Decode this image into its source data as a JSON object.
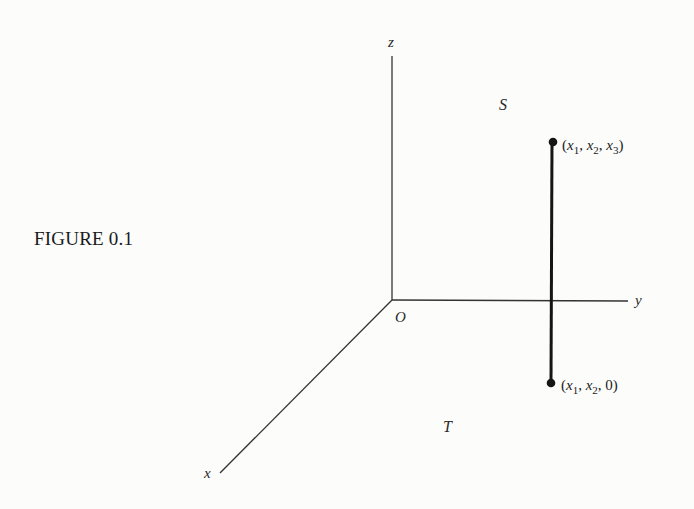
{
  "figure": {
    "caption": "FIGURE 0.1",
    "axes": {
      "origin_label": "O",
      "x_label": "x",
      "y_label": "y",
      "z_label": "z"
    },
    "region_labels": {
      "upper": "S",
      "lower": "T"
    },
    "points": [
      {
        "name": "top-point",
        "label": "(x1, x2, x3)",
        "parts": [
          "x",
          "1",
          "x",
          "2",
          "x",
          "3"
        ]
      },
      {
        "name": "bottom-point",
        "label": "(x1, x2, 0)",
        "parts": [
          "x",
          "1",
          "x",
          "2",
          "0"
        ]
      }
    ],
    "colors": {
      "line": "#2b2b2b",
      "segment": "#151515",
      "text": "#222222",
      "background": "#fcfcfb"
    }
  }
}
